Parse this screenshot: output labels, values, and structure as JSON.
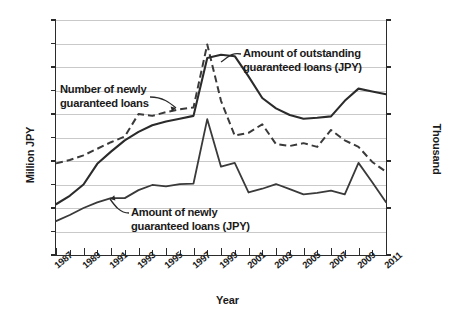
{
  "chart_data": {
    "type": "line",
    "title": "",
    "xlabel": "Year",
    "ylabel": "Million JPY",
    "y2label": "Thousand",
    "x": [
      1987,
      1988,
      1989,
      1990,
      1991,
      1992,
      1993,
      1994,
      1995,
      1996,
      1997,
      1998,
      1999,
      2000,
      2001,
      2002,
      2003,
      2004,
      2005,
      2006,
      2007,
      2008,
      2009,
      2010,
      2011
    ],
    "xlim": [
      1987,
      2011
    ],
    "xticks": [
      1987,
      1989,
      1991,
      1993,
      1995,
      1997,
      1999,
      2001,
      2003,
      2005,
      2007,
      2009,
      2011
    ],
    "xticklabels": [
      "1987",
      "1989",
      "1991",
      "1993",
      "1995",
      "1997",
      "1999",
      "2001",
      "2003",
      "2005",
      "2007",
      "2009",
      "2011"
    ],
    "ylim": [
      0,
      50
    ],
    "yticks": [
      0,
      5,
      10,
      15,
      20,
      25,
      30,
      35,
      40,
      45,
      50
    ],
    "yticklabels": [
      "0",
      "5",
      "10",
      "15",
      "20",
      "25",
      "30",
      "35",
      "40",
      "45",
      "50"
    ],
    "y2lim": [
      0,
      2500
    ],
    "y2ticks": [
      0,
      500,
      1000,
      1500,
      2000,
      2500
    ],
    "y2ticklabels": [
      "0",
      "500",
      "1,000",
      "1,500",
      "2,000",
      "2,500"
    ],
    "grid": true,
    "legend": "annotations",
    "series": [
      {
        "name": "Amount of outstanding guaranteed loans (JPY)",
        "axis": "left",
        "unit": "Million JPY",
        "style": "solid",
        "color": "#2b2b2b",
        "values": [
          10.8,
          12.6,
          15.0,
          19.4,
          22.0,
          24.4,
          26.2,
          27.6,
          28.4,
          29.0,
          29.6,
          41.9,
          42.6,
          42.3,
          38.0,
          33.4,
          31.2,
          29.8,
          29.0,
          29.2,
          29.5,
          32.8,
          35.4,
          34.8,
          34.2
        ]
      },
      {
        "name": "Number of newly guaranteed loans",
        "axis": "right",
        "unit": "Thousand",
        "style": "dashed",
        "color": "#3a3a3a",
        "values": [
          975,
          1010,
          1060,
          1130,
          1200,
          1260,
          1500,
          1480,
          1520,
          1550,
          1570,
          2240,
          1640,
          1270,
          1300,
          1390,
          1180,
          1160,
          1190,
          1150,
          1330,
          1220,
          1150,
          990,
          885
        ]
      },
      {
        "name": "Amount of newly guaranteed loans (JPY)",
        "axis": "left",
        "unit": "Million JPY",
        "style": "solid",
        "color": "#3a3a3a",
        "values": [
          7.2,
          8.5,
          10.0,
          11.2,
          12.1,
          12.1,
          13.8,
          14.9,
          14.6,
          15.1,
          15.2,
          28.9,
          18.8,
          19.6,
          13.3,
          14.1,
          15.1,
          14.0,
          12.9,
          13.2,
          13.7,
          12.9,
          19.6,
          15.5,
          11.2
        ]
      }
    ],
    "annotations": [
      {
        "id": "outstanding",
        "text_lines": [
          "Amount of outstanding",
          "guaranteed loans (JPY)"
        ],
        "points_to": "solid-upper-line"
      },
      {
        "id": "number",
        "text_lines": [
          "Number of newly",
          "guaranteed loans"
        ],
        "points_to": "dashed-line"
      },
      {
        "id": "newly",
        "text_lines": [
          "Amount of newly",
          "guaranteed loans (JPY)"
        ],
        "points_to": "solid-lower-line"
      }
    ]
  },
  "axes": {
    "x_title": "Year",
    "y_left_title": "Million JPY",
    "y_right_title": "Thousand"
  },
  "annotations": {
    "outstanding_line1": "Amount of outstanding",
    "outstanding_line2": "guaranteed loans (JPY)",
    "number_line1": "Number of newly",
    "number_line2": "guaranteed loans",
    "newly_line1": "Amount of newly",
    "newly_line2": "guaranteed loans (JPY)"
  },
  "colors": {
    "axis": "#2b2b2b",
    "grid": "#c9c9c9",
    "series_solid_dark": "#2b2b2b",
    "series_solid_mid": "#3a3a3a",
    "series_dashed": "#3a3a3a",
    "background": "#ffffff"
  }
}
